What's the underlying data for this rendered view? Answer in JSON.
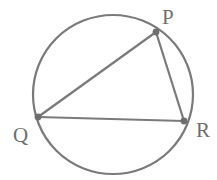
{
  "figure": {
    "background_color": "#ffffff",
    "stroke_color": "#7a7a7a",
    "label_color": "#6f6f6f",
    "dot_color": "#6e6e6e",
    "circle_stroke_width": 2.2,
    "chord_stroke_width": 2.2,
    "dot_radius": 3.4,
    "circle": {
      "name": "circumscribed-circle",
      "cx": 113,
      "cy": 94.5,
      "rx": 80,
      "ry": 79.5
    },
    "vertices": [
      {
        "id": "P",
        "label": "P",
        "x": 156,
        "y": 32,
        "label_x": 162,
        "label_y": 24
      },
      {
        "id": "Q",
        "label": "Q",
        "x": 38,
        "y": 117,
        "label_x": 13,
        "label_y": 142
      },
      {
        "id": "R",
        "label": "R",
        "x": 184,
        "y": 121,
        "label_x": 196,
        "label_y": 137
      }
    ],
    "chords": [
      {
        "id": "PQ",
        "name": "chord-pq",
        "from": "P",
        "to": "Q",
        "x1": 156,
        "y1": 32,
        "x2": 38,
        "y2": 117
      },
      {
        "id": "PR",
        "name": "chord-pr",
        "from": "P",
        "to": "R",
        "x1": 156,
        "y1": 32,
        "x2": 184,
        "y2": 121
      },
      {
        "id": "QR",
        "name": "chord-qr",
        "from": "Q",
        "to": "R",
        "x1": 38,
        "y1": 117,
        "x2": 184,
        "y2": 121
      }
    ]
  }
}
